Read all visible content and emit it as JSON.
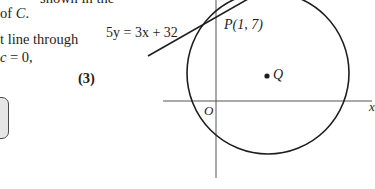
{
  "question_text": {
    "line1_partial": "shown in the",
    "line2": "of",
    "line2_var": "C",
    "line2_end": ".",
    "line3_partial": "t line through",
    "line4_partial_var": "c",
    "line4_partial_rest": " = 0,",
    "marks": "(3)"
  },
  "answer_box": {
    "fill_color": "#e6e6e6",
    "border_color": "#4a4a4a"
  },
  "diagram": {
    "tangent_label": "5y = 3x + 32",
    "point_p_label": "P(1, 7)",
    "point_q_label": "Q",
    "origin_label": "O",
    "x_axis_label_partial": "x",
    "circle": {
      "cx": 268,
      "cy": 73,
      "r": 81
    },
    "stroke_color": "#1e1e1e"
  }
}
